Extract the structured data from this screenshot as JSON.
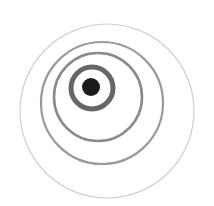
{
  "image": {
    "description": "Concentric-style rings with offset centers converging on a solid dark dot",
    "width": 214,
    "height": 206,
    "background": "#ffffff"
  },
  "shapes": {
    "outer_ring": {
      "cx": 107,
      "cy": 111,
      "r": 87,
      "stroke": "#cfcfcf",
      "stroke_width": 1.2
    },
    "ring_4": {
      "cx": 102,
      "cy": 103,
      "r": 61,
      "stroke": "#9a9a9a",
      "stroke_width": 2.2
    },
    "ring_3": {
      "cx": 98,
      "cy": 97,
      "r": 44,
      "stroke": "#8a8a8a",
      "stroke_width": 2.6
    },
    "ring_2": {
      "cx": 92,
      "cy": 88,
      "r": 21,
      "stroke": "#666666",
      "stroke_width": 5
    },
    "center_dot": {
      "cx": 91,
      "cy": 87,
      "r": 9,
      "fill": "#1a1a1a"
    }
  }
}
